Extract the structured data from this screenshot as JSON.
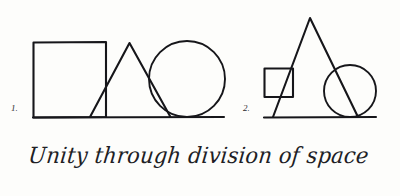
{
  "page": {
    "background_color": "#fdfdfb",
    "ink_color": "#16161a",
    "caption": "Unity through division of space"
  },
  "figures": [
    {
      "label": "1.",
      "name": "figure-one",
      "description": "square, triangle and circle overlapping on a common baseline",
      "shapes": [
        {
          "type": "square",
          "name": "square",
          "x": 33,
          "y": 42,
          "width": 73,
          "height": 75
        },
        {
          "type": "triangle",
          "name": "triangle",
          "points": "90,117 129,43 170,117"
        },
        {
          "type": "circle",
          "name": "circle",
          "cx": 187,
          "cy": 79,
          "r": 38
        },
        {
          "type": "line",
          "name": "baseline",
          "x1": 33,
          "y1": 117,
          "x2": 224,
          "y2": 117
        }
      ]
    },
    {
      "label": "2.",
      "name": "figure-two",
      "description": "small square, tall triangle and circle overlapping on a common baseline",
      "shapes": [
        {
          "type": "square",
          "name": "square",
          "x": 264,
          "y": 68,
          "width": 29,
          "height": 29
        },
        {
          "type": "triangle",
          "name": "triangle",
          "points": "273,117 310,18 358,117"
        },
        {
          "type": "circle",
          "name": "circle",
          "cx": 350,
          "cy": 91,
          "r": 26
        },
        {
          "type": "line",
          "name": "baseline",
          "x1": 264,
          "y1": 117,
          "x2": 376,
          "y2": 117
        }
      ]
    }
  ]
}
